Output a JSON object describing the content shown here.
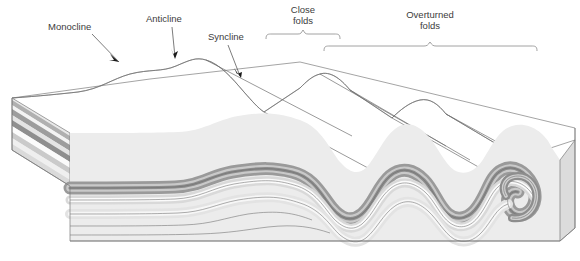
{
  "diagram": {
    "background": "#ffffff",
    "labels": [
      {
        "id": "monocline",
        "text": "Monocline",
        "x": 48,
        "y": 30,
        "anchor": "start",
        "leader": "M 92 34 L 119 62",
        "arrow_at": [
          119,
          62
        ],
        "arrow_angle": 46
      },
      {
        "id": "anticline",
        "text": "Anticline",
        "x": 146,
        "y": 22,
        "anchor": "start",
        "leader": "M 172 27 L 175 57",
        "arrow_at": [
          175,
          57
        ],
        "arrow_angle": 84
      },
      {
        "id": "syncline",
        "text": "Syncline",
        "x": 208,
        "y": 40,
        "anchor": "start",
        "leader": "M 228 45 L 240 75",
        "arrow_at": [
          240,
          75
        ],
        "arrow_angle": 68
      }
    ],
    "bracket_labels": [
      {
        "id": "close-folds",
        "line1": "Close",
        "line2": "folds",
        "cx": 303,
        "y1": 12,
        "y2": 23,
        "brace": {
          "x1": 266,
          "x2": 340,
          "y": 36,
          "tick_y": 30
        }
      },
      {
        "id": "overturned-folds",
        "line1": "Overturned",
        "line2": "folds",
        "cx": 430,
        "y1": 17,
        "y2": 28,
        "brace": {
          "x1": 324,
          "x2": 537,
          "y": 48,
          "tick_y": 42
        }
      }
    ],
    "strata": {
      "count": 9,
      "colors": [
        "#b9b9b9",
        "#f2f2f2",
        "#a8a8a8",
        "#e6e6e6",
        "#9e9e9e",
        "#fbfbfb",
        "#cfcfcf",
        "#ededed",
        "#dcdcdc"
      ],
      "top_surface_color": "#ffffff",
      "side_face_tint": "#d8d8d8",
      "outline_color": "#6b6b6b"
    },
    "structures": [
      "monocline",
      "anticline",
      "syncline",
      "close folds",
      "overturned folds"
    ]
  }
}
